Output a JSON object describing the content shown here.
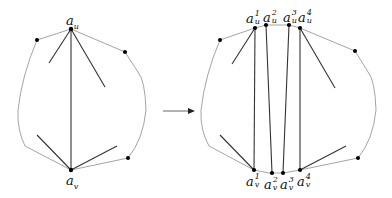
{
  "diagram": {
    "left_graph": {
      "top_vertex_label": "a",
      "top_vertex_sub": "u",
      "bottom_vertex_label": "a",
      "bottom_vertex_sub": "v"
    },
    "arrow": {
      "direction": "right"
    },
    "right_graph": {
      "top_labels": [
        {
          "base": "a",
          "sup": "1",
          "sub": "u"
        },
        {
          "base": "a",
          "sup": "2",
          "sub": "u"
        },
        {
          "base": "a",
          "sup": "3",
          "sub": "u"
        },
        {
          "base": "a",
          "sup": "4",
          "sub": "u"
        }
      ],
      "bottom_labels": [
        {
          "base": "a",
          "sup": "1",
          "sub": "v"
        },
        {
          "base": "a",
          "sup": "2",
          "sub": "v"
        },
        {
          "base": "a",
          "sup": "3",
          "sub": "v"
        },
        {
          "base": "a",
          "sup": "4",
          "sub": "v"
        }
      ]
    },
    "colors": {
      "edge_dark": "#333333",
      "edge_light": "#9a9a9a",
      "vertex": "#000000"
    }
  }
}
